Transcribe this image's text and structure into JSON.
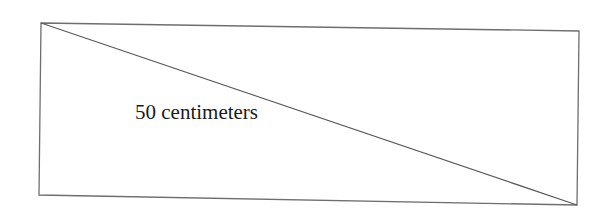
{
  "diagram": {
    "type": "rectangle-with-diagonal",
    "rectangle": {
      "corners": {
        "top_left": [
          41,
          23
        ],
        "top_right": [
          579,
          31
        ],
        "bottom_right": [
          577,
          205
        ],
        "bottom_left": [
          39,
          195
        ]
      }
    },
    "diagonal": {
      "from": "top_left",
      "to": "bottom_right"
    },
    "label": {
      "text": "50 centimeters",
      "refers_to": "diagonal"
    },
    "colors": {
      "stroke": "#6e6e6e",
      "diagonal": "#5a5a5a",
      "text": "#1a1a1a",
      "background": "#ffffff"
    }
  }
}
